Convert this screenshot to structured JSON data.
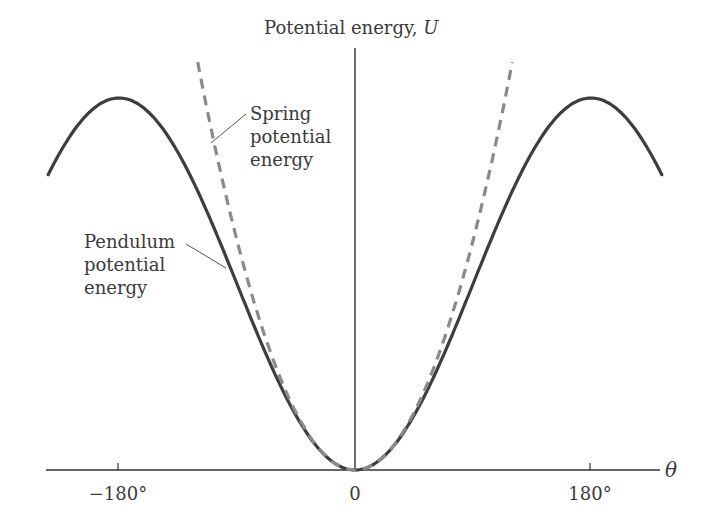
{
  "figure": {
    "y_axis_label": "Potential energy, ",
    "y_axis_symbol": "U",
    "x_axis_symbol": "θ",
    "ticks": [
      {
        "label": "−180°",
        "value": -180
      },
      {
        "label": "0",
        "value": 0
      },
      {
        "label": "180°",
        "value": 180
      }
    ],
    "annotations": {
      "spring": [
        "Spring",
        "potential",
        "energy"
      ],
      "pendulum": [
        "Pendulum",
        "potential",
        "energy"
      ]
    },
    "colors": {
      "pendulum_curve": "#3d3d3d",
      "spring_curve": "#8a8a8a",
      "axes": "#333333",
      "text": "#3a3a3a"
    }
  },
  "chart_data": {
    "type": "line",
    "title": "",
    "xlabel": "θ",
    "ylabel": "Potential energy, U",
    "xlim": [
      -240,
      240
    ],
    "x_ticks": [
      "−180°",
      "0",
      "180°"
    ],
    "grid": false,
    "legend_position": "inline annotations",
    "series": [
      {
        "name": "Pendulum potential energy",
        "style": "solid",
        "formula": "U = (1 - cos θ)",
        "x": [
          -235,
          -180,
          -135,
          -90,
          -45,
          0,
          45,
          90,
          135,
          180,
          235
        ],
        "values": [
          0.85,
          2.0,
          1.71,
          1.0,
          0.29,
          0.0,
          0.29,
          1.0,
          1.71,
          2.0,
          0.85
        ]
      },
      {
        "name": "Spring potential energy",
        "style": "dashed",
        "formula": "U = θ²/2 (θ in radians)",
        "x": [
          -118,
          -90,
          -45,
          0,
          45,
          90,
          118
        ],
        "values": [
          2.12,
          1.23,
          0.31,
          0.0,
          0.31,
          1.23,
          2.12
        ]
      }
    ]
  }
}
